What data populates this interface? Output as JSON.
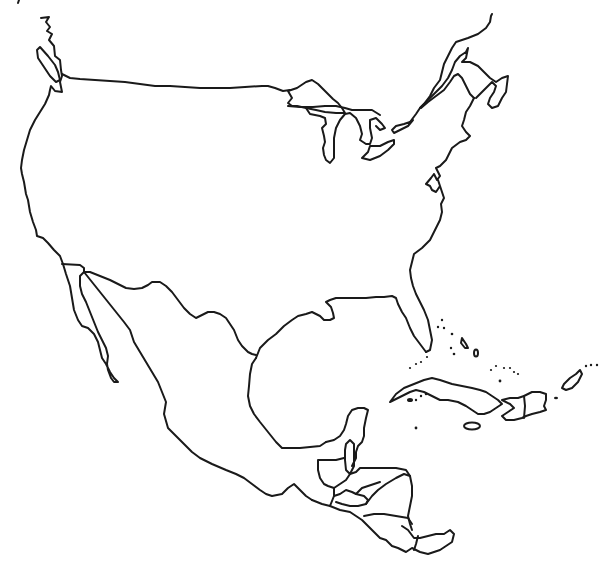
{
  "map": {
    "title": "Blank outline map of North America",
    "style": "black line art on white, no labels",
    "colors": {
      "background": "#ffffff",
      "stroke": "#1a1a1a"
    },
    "regions": [
      "United States",
      "Great Lakes",
      "Florida",
      "Mexico",
      "Baja California",
      "Gulf of Mexico",
      "Yucatan Peninsula",
      "Central America",
      "Cuba",
      "Hispaniola",
      "Jamaica",
      "Puerto Rico",
      "Bahamas"
    ],
    "labels": []
  }
}
